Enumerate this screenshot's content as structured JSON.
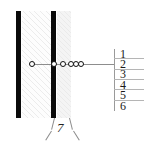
{
  "figure": {
    "colors": {
      "bar": "#0a0a0a",
      "line": "#8d8d8d",
      "text": "#1a1a1a",
      "hatch": "#fdfdfd",
      "shade": "#f4f4f4"
    },
    "bars": [
      {
        "label": "left-layer-bar"
      },
      {
        "label": "right-layer-bar"
      }
    ],
    "markers": [
      {
        "label": "marker-1",
        "x": 31
      },
      {
        "label": "marker-2",
        "x": 53
      },
      {
        "label": "marker-3",
        "x": 62
      },
      {
        "label": "marker-4",
        "x": 70
      },
      {
        "label": "marker-5",
        "x": 75
      },
      {
        "label": "marker-6",
        "x": 80
      }
    ],
    "callout_list": {
      "items": [
        {
          "number": "1"
        },
        {
          "number": "2"
        },
        {
          "number": "3"
        },
        {
          "number": "4"
        },
        {
          "number": "5"
        },
        {
          "number": "6"
        }
      ]
    },
    "bottom_callout": {
      "number": "7"
    }
  }
}
